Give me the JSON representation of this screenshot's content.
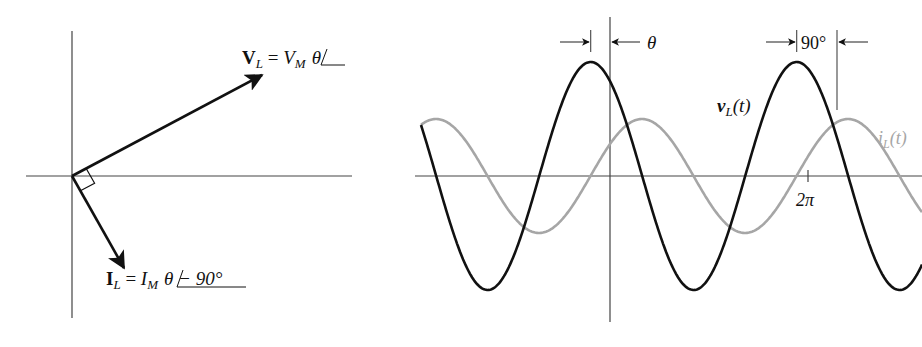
{
  "phasor_diagram": {
    "voltage_label": {
      "symbol": "V",
      "subscript": "L",
      "eq": " = ",
      "mag": "V",
      "mag_sub": "M",
      "angle": "θ"
    },
    "current_label": {
      "symbol": "I",
      "subscript": "L",
      "eq": " = ",
      "mag": "I",
      "mag_sub": "M",
      "angle": "θ − 90°"
    },
    "origin": [
      72,
      176
    ],
    "voltage_tip": [
      262,
      75
    ],
    "current_tip": [
      124,
      268
    ]
  },
  "waveform": {
    "theta_label": "θ",
    "phase_diff_label": "90°",
    "voltage_curve_label": {
      "name": "v",
      "sub": "L",
      "arg": "(t)"
    },
    "current_curve_label": {
      "name": "i",
      "sub": "L",
      "arg": "(t)"
    },
    "tick_label": "2π",
    "colors": {
      "voltage": "#111111",
      "current": "#a6a6a6",
      "axis": "#444444"
    }
  },
  "chart_data": {
    "type": "line",
    "title": "",
    "xlabel": "ωt",
    "ylabel": "",
    "x_ticks": [
      "2π"
    ],
    "series": [
      {
        "name": "v_L(t)",
        "amplitude": 1.0,
        "phase_deg": "θ",
        "color": "#111111"
      },
      {
        "name": "i_L(t)",
        "amplitude": 0.5,
        "phase_deg": "θ − 90°",
        "color": "#a6a6a6"
      }
    ],
    "annotations": [
      "θ",
      "90°"
    ],
    "grid": false
  }
}
